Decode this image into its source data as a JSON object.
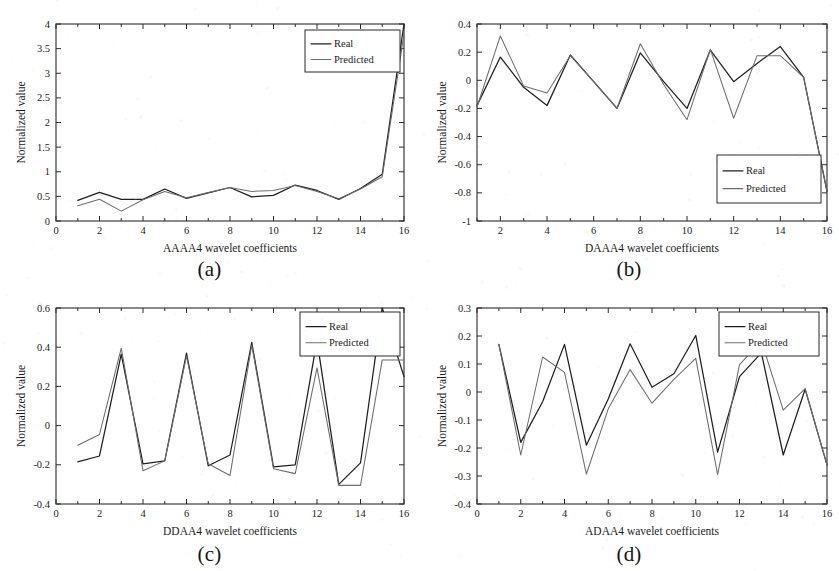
{
  "figure": {
    "background_color": "#ffffff",
    "real_color": "#1f1f1f",
    "predicted_color": "#6d6d6d",
    "legend": {
      "real_label": "Real",
      "predicted_label": "Predicted"
    }
  },
  "panels": [
    {
      "caption": "(a)",
      "xlabel": "AAAA4 wavelet coefficients",
      "ylabel": "Normalized value"
    },
    {
      "caption": "(b)",
      "xlabel": "DAAA4 wavelet coefficients",
      "ylabel": "Normalized value"
    },
    {
      "caption": "(c)",
      "xlabel": "DDAA4 wavelet coefficients",
      "ylabel": "Normalized value"
    },
    {
      "caption": "(d)",
      "xlabel": "ADAA4 wavelet coefficients",
      "ylabel": "Normalized value"
    }
  ],
  "chart_data": [
    {
      "type": "line",
      "title": "(a)",
      "xlabel": "AAAA4 wavelet coefficients",
      "ylabel": "Normalized value",
      "x": [
        1,
        2,
        3,
        4,
        5,
        6,
        7,
        8,
        9,
        10,
        11,
        12,
        13,
        14,
        15,
        16
      ],
      "xlim": [
        0,
        16
      ],
      "ylim": [
        0,
        4
      ],
      "xticks": [
        0,
        2,
        4,
        6,
        8,
        10,
        12,
        14,
        16
      ],
      "xticklabels": [
        "0",
        "2",
        "4",
        "6",
        "8",
        "10",
        "12",
        "14",
        "16"
      ],
      "yticks": [
        0,
        0.5,
        1,
        1.5,
        2,
        2.5,
        3,
        3.5,
        4
      ],
      "yticklabels": [
        "0",
        "0.5",
        "1",
        "1.5",
        "2",
        "2.5",
        "3",
        "3.5",
        "4"
      ],
      "grid": false,
      "legend_position": "top-right",
      "series": [
        {
          "name": "Real",
          "values": [
            0.42,
            0.58,
            0.44,
            0.44,
            0.65,
            0.46,
            0.57,
            0.68,
            0.49,
            0.52,
            0.73,
            0.62,
            0.44,
            0.66,
            0.95,
            4.0
          ]
        },
        {
          "name": "Predicted",
          "values": [
            0.31,
            0.44,
            0.2,
            0.43,
            0.6,
            0.47,
            0.58,
            0.68,
            0.6,
            0.62,
            0.72,
            0.6,
            0.45,
            0.65,
            0.9,
            3.8
          ]
        }
      ]
    },
    {
      "type": "line",
      "title": "(b)",
      "xlabel": "DAAA4 wavelet coefficients",
      "ylabel": "Normalized value",
      "x": [
        1,
        2,
        3,
        4,
        5,
        6,
        7,
        8,
        9,
        10,
        11,
        12,
        13,
        14,
        15,
        16
      ],
      "xlim": [
        1,
        16
      ],
      "ylim": [
        -1,
        0.4
      ],
      "xticks": [
        2,
        4,
        6,
        8,
        10,
        12,
        14,
        16
      ],
      "xticklabels": [
        "2",
        "4",
        "6",
        "8",
        "10",
        "12",
        "14",
        "16"
      ],
      "yticks": [
        0.4,
        0.2,
        0,
        -0.2,
        -0.4,
        -0.6,
        -0.8,
        -1
      ],
      "yticklabels": [
        "0.4",
        "0.2",
        "0",
        "-0.2",
        "-0.4",
        "-0.6",
        "-0.8",
        "-1"
      ],
      "grid": false,
      "legend_position": "bottom-right",
      "series": [
        {
          "name": "Real",
          "values": [
            -0.18,
            0.165,
            -0.05,
            -0.18,
            0.18,
            -0.01,
            -0.2,
            0.195,
            -0.01,
            -0.2,
            0.215,
            -0.01,
            0.12,
            0.24,
            0.02,
            -0.79
          ]
        },
        {
          "name": "Predicted",
          "values": [
            -0.19,
            0.315,
            -0.04,
            -0.09,
            0.175,
            -0.01,
            -0.2,
            0.26,
            -0.03,
            -0.28,
            0.22,
            -0.27,
            0.175,
            0.175,
            0.02,
            -0.79
          ]
        }
      ]
    },
    {
      "type": "line",
      "title": "(c)",
      "xlabel": "DDAA4 wavelet coefficients",
      "ylabel": "Normalized value",
      "x": [
        1,
        2,
        3,
        4,
        5,
        6,
        7,
        8,
        9,
        10,
        11,
        12,
        13,
        14,
        15,
        16
      ],
      "xlim": [
        0,
        16
      ],
      "ylim": [
        -0.4,
        0.6
      ],
      "xticks": [
        0,
        2,
        4,
        6,
        8,
        10,
        12,
        14,
        16
      ],
      "xticklabels": [
        "0",
        "2",
        "4",
        "6",
        "8",
        "10",
        "12",
        "14",
        "16"
      ],
      "yticks": [
        0.6,
        0.4,
        0.2,
        0,
        -0.2,
        -0.4
      ],
      "yticklabels": [
        "0.6",
        "0.4",
        "0.2",
        "0",
        "-0.2",
        "-0.4"
      ],
      "grid": false,
      "legend_position": "top-right",
      "series": [
        {
          "name": "Real",
          "values": [
            -0.185,
            -0.155,
            0.365,
            -0.195,
            -0.18,
            0.37,
            -0.205,
            -0.15,
            0.425,
            -0.21,
            -0.2,
            0.435,
            -0.3,
            -0.19,
            0.6,
            0.25
          ]
        },
        {
          "name": "Predicted",
          "values": [
            -0.1,
            -0.045,
            0.395,
            -0.23,
            -0.18,
            0.355,
            -0.195,
            -0.255,
            0.41,
            -0.22,
            -0.245,
            0.295,
            -0.305,
            -0.305,
            0.335,
            0.335
          ]
        }
      ]
    },
    {
      "type": "line",
      "title": "(d)",
      "xlabel": "ADAA4 wavelet coefficients",
      "ylabel": "Normalized value",
      "x": [
        1,
        2,
        3,
        4,
        5,
        6,
        7,
        8,
        9,
        10,
        11,
        12,
        13,
        14,
        15,
        16
      ],
      "xlim": [
        0,
        16
      ],
      "ylim": [
        -0.4,
        0.3
      ],
      "xticks": [
        0,
        2,
        4,
        6,
        8,
        10,
        12,
        14,
        16
      ],
      "xticklabels": [
        "0",
        "2",
        "4",
        "6",
        "8",
        "10",
        "12",
        "14",
        "16"
      ],
      "yticks": [
        0.3,
        0.2,
        0.1,
        0,
        -0.1,
        -0.2,
        -0.3,
        -0.4
      ],
      "yticklabels": [
        "0.3",
        "0.2",
        "0.1",
        "0",
        "-0.1",
        "-0.2",
        "-0.3",
        "-0.4"
      ],
      "grid": false,
      "legend_position": "top-right",
      "series": [
        {
          "name": "Real",
          "values": [
            0.17,
            -0.18,
            -0.035,
            0.17,
            -0.19,
            -0.025,
            0.172,
            0.017,
            0.065,
            0.202,
            -0.215,
            0.055,
            0.14,
            -0.225,
            0.01,
            -0.26
          ]
        },
        {
          "name": "Predicted",
          "values": [
            0.17,
            -0.225,
            0.125,
            0.07,
            -0.293,
            -0.06,
            0.08,
            -0.04,
            0.045,
            0.12,
            -0.295,
            0.098,
            0.182,
            -0.065,
            0.012,
            -0.26
          ]
        }
      ]
    }
  ]
}
